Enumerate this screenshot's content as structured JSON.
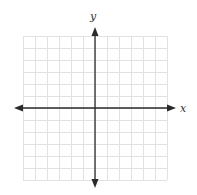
{
  "graph": {
    "x_label": "x",
    "y_label": "y",
    "grid": {
      "columns": 12,
      "rows": 12,
      "cell_size_px": 12,
      "left": 23,
      "top": 36,
      "color": "#e2e2e2"
    },
    "axes": {
      "origin_px": [
        95,
        108
      ],
      "x_range_px": [
        14,
        176
      ],
      "y_range_px": [
        27,
        188
      ],
      "color": "#2a2a2a"
    }
  }
}
